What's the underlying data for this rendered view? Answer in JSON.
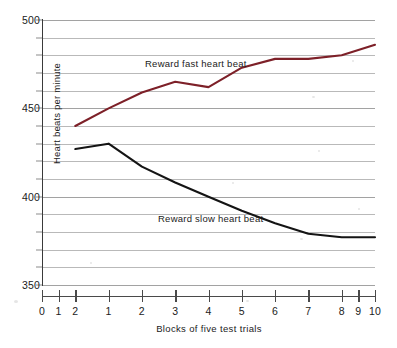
{
  "chart_data": {
    "type": "line",
    "title": "",
    "xlabel": "Blocks of five test trials",
    "ylabel": "Heart beats per minute",
    "xlim": [
      0,
      10
    ],
    "ylim": [
      350,
      500
    ],
    "grid": true,
    "gridline_step": 10,
    "legend_position": "inline-annotation",
    "x_tick_labels": [
      "0",
      "1",
      "2",
      "1",
      "2",
      "3",
      "4",
      "5",
      "6",
      "7",
      "8",
      "9",
      "10"
    ],
    "x_tick_values": [
      0,
      0.5,
      1,
      2,
      3,
      4,
      5,
      6,
      7,
      8,
      9,
      9.5,
      10
    ],
    "y_tick_labels": [
      "350",
      "400",
      "450",
      "500"
    ],
    "y_tick_values": [
      350,
      400,
      450,
      500
    ],
    "gridline_values": [
      350,
      360,
      370,
      380,
      390,
      400,
      410,
      420,
      430,
      440,
      450,
      460,
      470,
      480,
      490,
      500
    ],
    "series": [
      {
        "name": "Reward fast heart beat",
        "color": "#7d2028",
        "annotation": "Reward fast heart beat",
        "x": [
          1,
          2,
          3,
          4,
          5,
          6,
          7,
          8,
          9,
          10
        ],
        "values": [
          440,
          450,
          459,
          465,
          462,
          473,
          478,
          478,
          480,
          486
        ]
      },
      {
        "name": "Reward slow heart beat",
        "color": "#141414",
        "annotation": "Reward slow heart beat",
        "x": [
          1,
          2,
          3,
          4,
          5,
          6,
          7,
          8,
          9,
          10
        ],
        "values": [
          427,
          430,
          417,
          408,
          400,
          392,
          385,
          379,
          377,
          377
        ]
      }
    ]
  },
  "axis": {
    "y_title": "Heart beats per minute",
    "x_title": "Blocks of five test trials"
  },
  "annotations": {
    "fast": "Reward fast heart beat",
    "slow": "Reward slow heart beat"
  }
}
